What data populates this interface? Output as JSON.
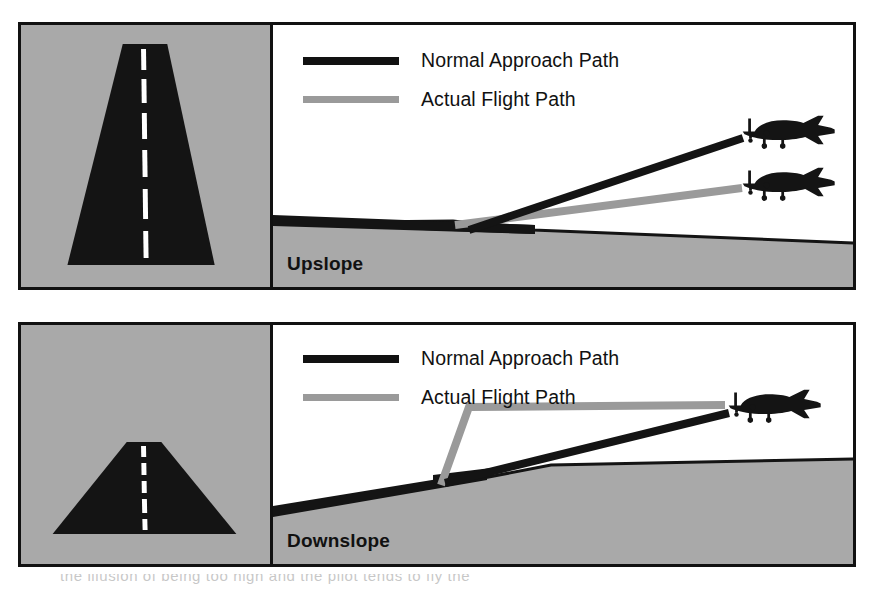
{
  "figure": {
    "colors": {
      "ground_gray": "#a9a9a9",
      "runway_black": "#111111",
      "normal_path": "#111111",
      "actual_path": "#9a9a9a",
      "border": "#111111",
      "background": "#ffffff"
    }
  },
  "panels": [
    {
      "id": "upslope",
      "caption": "Upslope",
      "legend": [
        {
          "label": "Normal Approach Path",
          "style": "solid-black",
          "icon": "line-swatch-icon"
        },
        {
          "label": "Actual Flight Path",
          "style": "solid-gray",
          "icon": "line-swatch-icon"
        }
      ],
      "plan_view": {
        "description": "Runway seen from approach; narrow tall trapezoid indicating upsloping runway appears longer",
        "centerline": "dashed-white",
        "runway_color": "#111111",
        "terrain_color": "#a9a9a9"
      },
      "profile": {
        "terrain": "ground rises slightly toward runway then falls away to the right",
        "normal_path_shape": "straight",
        "actual_path_shape": "straight-but-shallower",
        "aircraft_count": 2,
        "note": "Actual flight path is lower than normal approach path"
      }
    },
    {
      "id": "downslope",
      "caption": "Downslope",
      "legend": [
        {
          "label": "Normal Approach Path",
          "style": "solid-black",
          "icon": "line-swatch-icon"
        },
        {
          "label": "Actual Flight Path",
          "style": "solid-gray",
          "icon": "line-swatch-icon"
        }
      ],
      "plan_view": {
        "description": "Runway seen from approach; short wide triangle indicating downsloping runway appears shorter",
        "centerline": "dashed-white",
        "runway_color": "#111111",
        "terrain_color": "#a9a9a9"
      },
      "profile": {
        "terrain": "ground rises from left to the runway then continues level to the right",
        "normal_path_shape": "straight",
        "actual_path_shape": "bent-level-then-steep",
        "aircraft_count": 1,
        "note": "Actual flight path is higher than normal approach path"
      }
    }
  ],
  "scan_bleed": {
    "text": "the illusion of being too high and the pilot tends to fly the"
  }
}
